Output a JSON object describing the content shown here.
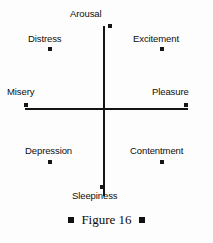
{
  "figure": {
    "caption_text": "Figure 16",
    "caption_marker": "filled-square",
    "background_color": "#fdfdfd",
    "ink_color": "#141414"
  },
  "chart_data": {
    "type": "scatter",
    "title": "Figure 16",
    "xlabel": "",
    "ylabel": "",
    "grid": false,
    "legend": "none",
    "axes": {
      "vertical": {
        "top_label": "Arousal",
        "bottom_label": "Sleepiness"
      },
      "horizontal": {
        "left_label": "Misery",
        "right_label": "Pleasure"
      }
    },
    "xlim": [
      -1,
      1
    ],
    "ylim": [
      -1,
      1
    ],
    "points": [
      {
        "label": "Arousal",
        "x": 0.0,
        "y": 1.0
      },
      {
        "label": "Excitement",
        "x": 0.68,
        "y": 0.72
      },
      {
        "label": "Distress",
        "x": -0.68,
        "y": 0.72
      },
      {
        "label": "Misery",
        "x": -1.0,
        "y": 0.0
      },
      {
        "label": "Pleasure",
        "x": 1.0,
        "y": 0.0
      },
      {
        "label": "Depression",
        "x": -0.68,
        "y": -0.62
      },
      {
        "label": "Contentment",
        "x": 0.68,
        "y": -0.62
      },
      {
        "label": "Sleepiness",
        "x": 0.0,
        "y": -0.92
      }
    ]
  },
  "labels": {
    "arousal": "Arousal",
    "excitement": "Excitement",
    "distress": "Distress",
    "misery": "Misery",
    "pleasure": "Pleasure",
    "depression": "Depression",
    "contentment": "Contentment",
    "sleepiness": "Sleepiness"
  }
}
